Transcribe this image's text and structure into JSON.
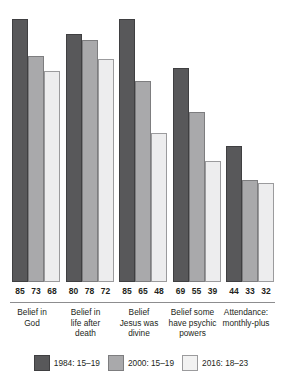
{
  "chart_data": {
    "type": "bar",
    "title": "",
    "subtitle": "",
    "xlabel": "",
    "ylabel": "",
    "ylim": [
      0,
      100
    ],
    "grid": false,
    "legend_position": "bottom",
    "orientation": "vertical",
    "grouped": true,
    "categories": [
      "Belief in God",
      "Belief in life after death",
      "Belief Jesus was divine",
      "Belief some have psychic powers",
      "Attendance: monthly-plus"
    ],
    "category_lines": [
      [
        "Belief in",
        "God"
      ],
      [
        "Belief in",
        "life after",
        "death"
      ],
      [
        "Belief",
        "Jesus was",
        "divine"
      ],
      [
        "Belief some",
        "have psychic",
        "powers"
      ],
      [
        "Attendance:",
        "monthly-plus"
      ]
    ],
    "series": [
      {
        "name": "1984: 15–19",
        "color": "#58585a",
        "values": [
          85,
          80,
          85,
          69,
          44
        ]
      },
      {
        "name": "2000: 15–19",
        "color": "#a9a9ab",
        "values": [
          73,
          78,
          65,
          55,
          33
        ]
      },
      {
        "name": "2016: 18–23",
        "color": "#ededee",
        "values": [
          68,
          72,
          48,
          39,
          32
        ]
      }
    ],
    "data_labels": [
      [
        "85",
        "73",
        "68"
      ],
      [
        "80",
        "78",
        "72"
      ],
      [
        "85",
        "65",
        "48"
      ],
      [
        "69",
        "55",
        "39"
      ],
      [
        "44",
        "33",
        "32"
      ]
    ]
  },
  "legend": {
    "items": [
      {
        "label": "1984: 15–19",
        "swatch": "dark-gray-swatch"
      },
      {
        "label": "2000: 15–19",
        "swatch": "medium-gray-swatch"
      },
      {
        "label": "2016: 18–23",
        "swatch": "light-gray-swatch"
      }
    ]
  },
  "colors": {
    "series_1984": "#58585a",
    "series_2000": "#a9a9ab",
    "series_2016": "#ededee",
    "axis_rule": "#8d8d8f",
    "text": "#231f20",
    "background": "#ffffff"
  }
}
